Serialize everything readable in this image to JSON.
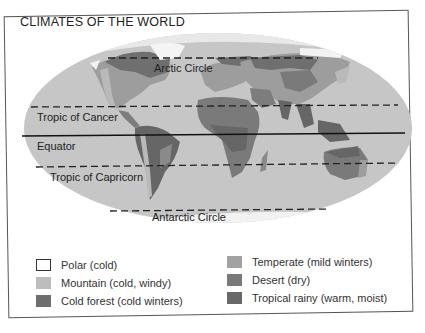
{
  "title": "CLIMATES OF THE WORLD",
  "map": {
    "projection": "world-ellipse",
    "lines": [
      {
        "id": "arctic",
        "label": "Arctic Circle",
        "style": "dashed",
        "y": 58
      },
      {
        "id": "cancer",
        "label": "Tropic of Cancer",
        "style": "dashed",
        "y": 108
      },
      {
        "id": "equator",
        "label": "Equator",
        "style": "solid",
        "y": 136
      },
      {
        "id": "capricorn",
        "label": "Tropic of Capricorn",
        "style": "dashed",
        "y": 166
      },
      {
        "id": "antarctic",
        "label": "Antarctic Circle",
        "style": "dashed",
        "y": 210
      }
    ],
    "colors": {
      "ocean": "#c4c4c4",
      "polar": "#ffffff",
      "mountain": "#b9b9b9",
      "cold_forest": "#6f6f6f",
      "temperate": "#9d9d9d",
      "desert": "#7d7d7d",
      "tropical": "#666666"
    }
  },
  "legend": {
    "items": [
      {
        "label": "Polar (cold)",
        "color": "#ffffff"
      },
      {
        "label": "Mountain (cold, windy)",
        "color": "#bdbdbd"
      },
      {
        "label": "Cold forest (cold winters)",
        "color": "#6e6e6e"
      },
      {
        "label": "Temperate (mild winters)",
        "color": "#a2a2a2"
      },
      {
        "label": "Desert (dry)",
        "color": "#7a7a7a"
      },
      {
        "label": "Tropical rainy (warm, moist)",
        "color": "#686868"
      }
    ]
  }
}
